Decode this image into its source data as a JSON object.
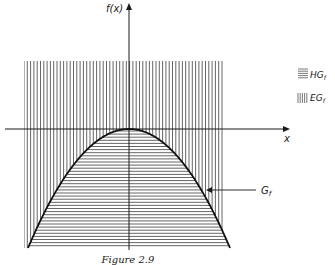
{
  "figure": {
    "caption": "Figure 2.9",
    "y_axis_label": "f(x)",
    "x_axis_label": "x",
    "curve_label": "G",
    "curve_label_sub": "f",
    "function": "concave parabola with vertex at origin, f(x) = -a·x²",
    "legend": [
      {
        "pattern": "horizontal-hatch",
        "label": "HG",
        "sub": "f",
        "meaning": "hypograph"
      },
      {
        "pattern": "vertical-hatch",
        "label": "EG",
        "sub": "f",
        "meaning": "epigraph"
      }
    ],
    "colors": {
      "ink": "#1a1a1a",
      "hatch": "#555555",
      "background": "#ffffff"
    }
  }
}
